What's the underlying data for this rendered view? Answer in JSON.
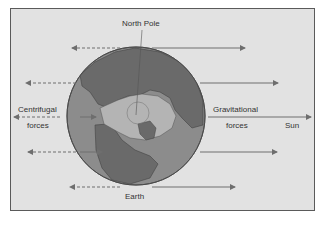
{
  "diagram": {
    "labels": {
      "north_pole": "North Pole",
      "centrifugal_line1": "Centrifugal",
      "centrifugal_line2": "forces",
      "gravitational_line1": "Gravitational",
      "gravitational_line2": "forces",
      "sun": "Sun",
      "earth": "Earth"
    },
    "colors": {
      "background": "#e2e2e2",
      "frame": "#5a5a5a",
      "ocean": "#8c8c8c",
      "land": "#6a6a6a",
      "ice": "#b4b4b4",
      "arrow": "#6e6e6e",
      "text": "#333333"
    },
    "arrows": {
      "centrifugal_dashed": [
        {
          "from_x": 120,
          "to_x": 72,
          "y": 48
        },
        {
          "from_x": 76,
          "to_x": 26,
          "y": 83
        },
        {
          "from_x": 60,
          "to_x": 14,
          "y": 117
        },
        {
          "from_x": 76,
          "to_x": 28,
          "y": 152
        },
        {
          "from_x": 120,
          "to_x": 70,
          "y": 187
        }
      ],
      "gravitational_solid": [
        {
          "from_x": 152,
          "to_x": 245,
          "y": 48
        },
        {
          "from_x": 200,
          "to_x": 278,
          "y": 83
        },
        {
          "from_x": 208,
          "to_x": 311,
          "y": 117
        },
        {
          "from_x": 200,
          "to_x": 277,
          "y": 152
        },
        {
          "from_x": 152,
          "to_x": 235,
          "y": 187
        }
      ]
    }
  }
}
